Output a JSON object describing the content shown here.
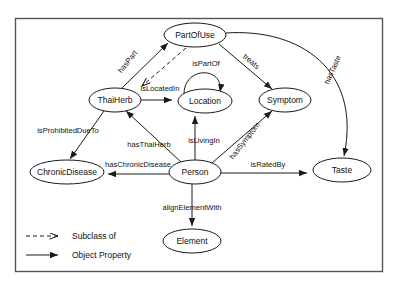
{
  "diagram": {
    "kind": "ontology-graph",
    "nodes": [
      {
        "id": "partofuse",
        "label": "PartOfUse",
        "cx": 195,
        "cy": 35,
        "rx": 31,
        "ry": 12
      },
      {
        "id": "thaiherb",
        "label": "ThaiHerb",
        "cx": 115,
        "cy": 100,
        "rx": 26,
        "ry": 12
      },
      {
        "id": "location",
        "label": "Location",
        "cx": 205,
        "cy": 101,
        "rx": 27,
        "ry": 12
      },
      {
        "id": "symptom",
        "label": "Symptom",
        "cx": 285,
        "cy": 100,
        "rx": 26,
        "ry": 12
      },
      {
        "id": "taste",
        "label": "Taste",
        "cx": 342,
        "cy": 170,
        "rx": 29,
        "ry": 12
      },
      {
        "id": "chronicdisease",
        "label": "ChronicDisease",
        "cx": 67,
        "cy": 172,
        "rx": 37,
        "ry": 12
      },
      {
        "id": "person",
        "label": "Person",
        "cx": 195,
        "cy": 172,
        "rx": 26,
        "ry": 12
      },
      {
        "id": "element",
        "label": "Element",
        "cx": 192,
        "cy": 241,
        "rx": 29,
        "ry": 12
      }
    ],
    "edges": [
      {
        "id": "haspart",
        "label": "hasPart",
        "from": "thaiherb",
        "to": "partofuse",
        "type": "object-property",
        "label_x": 128,
        "label_y": 62,
        "label_rotate": -52
      },
      {
        "id": "subclass-partofuse",
        "label": "",
        "from": "partofuse",
        "to": "thaiherb",
        "type": "subclass-of",
        "label_x": 0,
        "label_y": 0,
        "label_rotate": 0
      },
      {
        "id": "islocatedin",
        "label": "isLocatedIn",
        "from": "thaiherb",
        "to": "location",
        "type": "object-property",
        "label_x": 160,
        "label_y": 89,
        "label_rotate": 0
      },
      {
        "id": "ispartof",
        "label": "isPartOf",
        "from": "location",
        "to": "location",
        "type": "object-property",
        "label_x": 206,
        "label_y": 64,
        "label_rotate": 0
      },
      {
        "id": "treats",
        "label": "treats",
        "from": "partofuse",
        "to": "symptom",
        "type": "object-property",
        "label_x": 251,
        "label_y": 62,
        "label_rotate": 41
      },
      {
        "id": "hastaste",
        "label": "hasTaste",
        "from": "partofuse",
        "to": "taste",
        "type": "object-property",
        "label_x": 333,
        "label_y": 70,
        "label_rotate": -66
      },
      {
        "id": "isprohibitedducto",
        "label": "isProhibitedDueTo",
        "from": "thaiherb",
        "to": "chronicdisease",
        "type": "object-property",
        "label_x": 68,
        "label_y": 131,
        "label_rotate": 0
      },
      {
        "id": "hasthaiherb",
        "label": "hasThaiHerb",
        "from": "person",
        "to": "thaiherb",
        "type": "object-property",
        "label_x": 149,
        "label_y": 145,
        "label_rotate": 0
      },
      {
        "id": "haschronicdisease",
        "label": "hasChronicDisease",
        "from": "person",
        "to": "chronicdisease",
        "type": "object-property",
        "label_x": 138,
        "label_y": 165,
        "label_rotate": 0
      },
      {
        "id": "islivingin",
        "label": "isLivingIn",
        "from": "person",
        "to": "location",
        "type": "object-property",
        "label_x": 204,
        "label_y": 141,
        "label_rotate": 0
      },
      {
        "id": "hassymptom",
        "label": "hasSymptom",
        "from": "person",
        "to": "symptom",
        "type": "object-property",
        "label_x": 245,
        "label_y": 141,
        "label_rotate": -52
      },
      {
        "id": "isratedby",
        "label": "isRatedBy",
        "from": "person",
        "to": "taste",
        "type": "object-property",
        "label_x": 268,
        "label_y": 165,
        "label_rotate": 0
      },
      {
        "id": "alignelementwith",
        "label": "alignElementWith",
        "from": "person",
        "to": "element",
        "type": "object-property",
        "label_x": 192,
        "label_y": 208,
        "label_rotate": 0
      }
    ],
    "legend": {
      "items": [
        {
          "id": "subclass-of",
          "label": "Subclass of",
          "style": "dashed"
        },
        {
          "id": "object-property",
          "label": "Object Property",
          "style": "solid"
        }
      ]
    },
    "colors": {
      "stroke": "#1a1a1a",
      "node_fill": "#ffffff",
      "frame": "#555555",
      "background": "#ffffff",
      "text": "#111111"
    }
  }
}
